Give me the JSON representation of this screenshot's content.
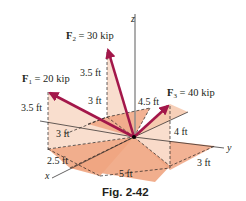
{
  "figure": {
    "caption": "Fig. 2-42",
    "axes": {
      "x": "x",
      "y": "y",
      "z": "z"
    },
    "forces": [
      {
        "name": "F",
        "sub": "1",
        "label_rest": " = 20 kip",
        "magnitude": "20 kip"
      },
      {
        "name": "F",
        "sub": "2",
        "label_rest": " = 30 kip",
        "magnitude": "30 kip"
      },
      {
        "name": "F",
        "sub": "3",
        "label_rest": " = 40 kip",
        "magnitude": "40 kip"
      }
    ],
    "dimensions": {
      "f2_height": "3.5 ft",
      "f2_offset": "3 ft",
      "f1_height": "3.5 ft",
      "f1_offset": "3 ft",
      "f1_x": "2.5 ft",
      "bottom_span": "5 ft",
      "f3_offset": "4.5 ft",
      "f3_height": "4 ft",
      "f3_x": "3 ft"
    },
    "colors": {
      "arrow": "#a3174a",
      "plane_dark": "#f0a581",
      "plane_light": "#f9dccb",
      "plane_mid": "#f5c4a7",
      "line": "#231f20",
      "axis_z": "#8a8a8a"
    }
  }
}
